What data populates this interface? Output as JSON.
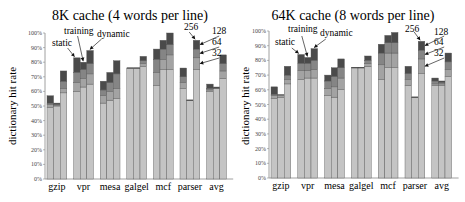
{
  "chart_data": [
    {
      "type": "bar",
      "stacked": true,
      "grouped": true,
      "title": "8K cache (4 words per line)",
      "xlabel": "",
      "ylabel": "dictionary hit rate",
      "ylim": [
        0,
        100
      ],
      "yticks": [
        "0%",
        "10%",
        "20%",
        "30%",
        "40%",
        "50%",
        "60%",
        "70%",
        "80%",
        "90%",
        "100%"
      ],
      "categories": [
        "gzip",
        "vpr",
        "mesa",
        "galgel",
        "mcf",
        "parser",
        "avg"
      ],
      "bars_per_group": [
        "static",
        "training",
        "dynamic"
      ],
      "stack_levels": [
        "32",
        "64",
        "128",
        "256"
      ],
      "annotations": [
        "static",
        "training",
        "dynamic",
        "256",
        "128",
        "64",
        "32"
      ],
      "values_cumulative": {
        "gzip": {
          "static": [
            49,
            51,
            52,
            57
          ],
          "training": [
            50,
            50,
            51,
            52
          ],
          "dynamic": [
            59,
            62,
            67,
            74
          ]
        },
        "vpr": {
          "static": [
            60,
            66,
            73,
            83
          ],
          "training": [
            63,
            69,
            75,
            80
          ],
          "dynamic": [
            65,
            72,
            79,
            88
          ]
        },
        "mesa": {
          "static": [
            52,
            57,
            61,
            67
          ],
          "training": [
            54,
            60,
            66,
            73
          ],
          "dynamic": [
            55,
            62,
            72,
            81
          ]
        },
        "galgel": {
          "static": [
            76,
            76,
            76,
            76
          ],
          "training": [
            76,
            76,
            76,
            76
          ],
          "dynamic": [
            77,
            79,
            81,
            84
          ]
        },
        "mcf": {
          "static": [
            64,
            73,
            82,
            89
          ],
          "training": [
            75,
            82,
            89,
            95
          ],
          "dynamic": [
            75,
            85,
            92,
            100
          ]
        },
        "parser": {
          "static": [
            62,
            66,
            70,
            76
          ],
          "training": [
            54,
            54,
            54,
            54
          ],
          "dynamic": [
            75,
            83,
            89,
            95
          ]
        },
        "avg": {
          "static": [
            60,
            61,
            62,
            65
          ],
          "training": [
            62,
            62,
            62,
            63
          ],
          "dynamic": [
            69,
            74,
            79,
            85
          ]
        }
      },
      "grid": false,
      "legend_position": "inline-annotations"
    },
    {
      "type": "bar",
      "stacked": true,
      "grouped": true,
      "title": "64K cache (8 words per line)",
      "xlabel": "",
      "ylabel": "dictionary hit rate",
      "ylim": [
        0,
        100
      ],
      "yticks": [
        "0%",
        "10%",
        "20%",
        "30%",
        "40%",
        "50%",
        "60%",
        "70%",
        "80%",
        "90%",
        "100%"
      ],
      "categories": [
        "gzip",
        "vpr",
        "mesa",
        "galgel",
        "mcf",
        "parser",
        "avg"
      ],
      "bars_per_group": [
        "static",
        "training",
        "dynamic"
      ],
      "stack_levels": [
        "32",
        "64",
        "128",
        "256"
      ],
      "annotations": [
        "static",
        "training",
        "dynamic",
        "256",
        "128",
        "64",
        "32"
      ],
      "values_cumulative": {
        "gzip": {
          "static": [
            54,
            56,
            57,
            62
          ],
          "training": [
            55,
            56,
            57,
            57
          ],
          "dynamic": [
            64,
            67,
            70,
            76
          ]
        },
        "vpr": {
          "static": [
            67,
            73,
            78,
            84
          ],
          "training": [
            68,
            73,
            78,
            82
          ],
          "dynamic": [
            68,
            74,
            80,
            88
          ]
        },
        "mesa": {
          "static": [
            56,
            61,
            66,
            70
          ],
          "training": [
            55,
            62,
            69,
            75
          ],
          "dynamic": [
            60,
            68,
            75,
            81
          ]
        },
        "galgel": {
          "static": [
            75,
            75,
            75,
            75
          ],
          "training": [
            75,
            75,
            75,
            75
          ],
          "dynamic": [
            76,
            78,
            80,
            83
          ]
        },
        "mcf": {
          "static": [
            67,
            77,
            85,
            91
          ],
          "training": [
            75,
            85,
            92,
            97
          ],
          "dynamic": [
            75,
            85,
            92,
            99
          ]
        },
        "parser": {
          "static": [
            63,
            67,
            71,
            76
          ],
          "training": [
            55,
            55,
            55,
            55
          ],
          "dynamic": [
            71,
            81,
            87,
            93
          ]
        },
        "avg": {
          "static": [
            63,
            64,
            66,
            68
          ],
          "training": [
            63,
            64,
            65,
            66
          ],
          "dynamic": [
            69,
            74,
            79,
            85
          ]
        }
      },
      "grid": false,
      "legend_position": "inline-annotations"
    }
  ],
  "colors": {
    "level_32": "#c4c4c4",
    "level_64": "#a3a3a3",
    "level_128": "#858585",
    "level_256": "#4a4a4a",
    "outline": "#555555",
    "axis": "#888888"
  },
  "panels": [
    {
      "title": "8K cache (4 words per line)",
      "ylabel": "dictionary hit rate",
      "ann_static": "static",
      "ann_training": "training",
      "ann_dynamic": "dynamic",
      "ann_256": "256",
      "ann_128": "128",
      "ann_64": "64",
      "ann_32": "32"
    },
    {
      "title": "64K cache (8 words per line)",
      "ylabel": "dictionary hit rate",
      "ann_static": "static",
      "ann_training": "training",
      "ann_dynamic": "dynamic",
      "ann_256": "256",
      "ann_128": "128",
      "ann_64": "64",
      "ann_32": "32"
    }
  ]
}
